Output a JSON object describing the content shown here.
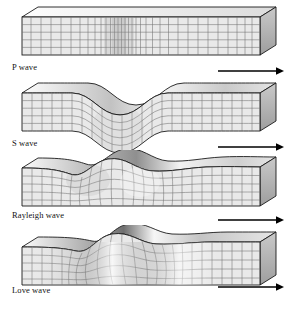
{
  "figure": {
    "background_color": "#ffffff",
    "width": 300,
    "height": 311,
    "arrow_label": "direction of wave propagation",
    "arrow_direction": "right"
  },
  "colors": {
    "outline": "#1a1a1a",
    "grid_line": "#6f6f6f",
    "front_face_fill": "#e9e9e9",
    "top_face_fill": "#f2f2f2",
    "side_face_fill": "#b4b4b4",
    "shadow_dark": "#8a8a8a",
    "highlight_light": "#fbfbfb",
    "arrow_color": "#000000",
    "label_color": "#121212"
  },
  "panels": [
    {
      "id": "p-wave",
      "label": "P wave",
      "motion": "compressional",
      "description": "Compression and dilatation bands shown by varying vertical grid line spacing; block outline remains straight.",
      "label_x": 12,
      "label_y": 67,
      "block_top": 9,
      "block_height": 46,
      "arrow": {
        "x1": 218,
        "y1": 71,
        "x2": 282,
        "y2": 71
      }
    },
    {
      "id": "s-wave",
      "label": "S wave",
      "motion": "shear-vertical",
      "description": "Entire block displaced vertically in a sine wave; grid squares tilt but keep constant spacing.",
      "label_x": 12,
      "label_y": 143,
      "block_top": 85,
      "block_height": 46,
      "arrow": {
        "x1": 218,
        "y1": 147,
        "x2": 282,
        "y2": 147
      }
    },
    {
      "id": "rayleigh-wave",
      "label": "Rayleigh wave",
      "motion": "surface-elliptical",
      "description": "Flat base with undulating top surface; retrograde elliptical particle motion distorts the near-surface grid.",
      "label_x": 12,
      "label_y": 216,
      "block_top": 158,
      "block_height": 48,
      "arrow": {
        "x1": 218,
        "y1": 220,
        "x2": 282,
        "y2": 220
      }
    },
    {
      "id": "love-wave",
      "label": "Love wave",
      "motion": "surface-horizontal-shear",
      "description": "Side-to-side horizontal shearing of the surface layer; grid lines bow laterally with bright and dark shading.",
      "label_x": 12,
      "label_y": 291,
      "block_top": 232,
      "block_height": 48,
      "arrow": {
        "x1": 218,
        "y1": 287,
        "x2": 282,
        "y2": 287
      }
    }
  ]
}
